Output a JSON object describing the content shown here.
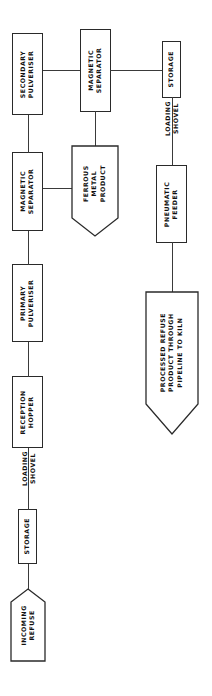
{
  "diagram": {
    "type": "process-flowchart",
    "orientation": "rotated-90-ccw",
    "title_visible": false,
    "background_color": "#ffffff",
    "line_color": "#3a3a3a",
    "text_color": "#111111",
    "nodes": [
      {
        "id": "incoming-refuse",
        "label": "INCOMING\nREFUSE",
        "line1": "INCOMING",
        "line2": "REFUSE",
        "shape": "pentagon",
        "role": "input-terminator"
      },
      {
        "id": "storage-in",
        "label": "STORAGE",
        "line1": "STORAGE",
        "shape": "rectangle",
        "role": "process"
      },
      {
        "id": "loading-shovel-1",
        "label": "LOADING\nSHOVEL",
        "line1": "LOADING",
        "line2": "SHOVEL",
        "shape": "edge-label",
        "role": "transport-annotation"
      },
      {
        "id": "reception-hopper",
        "label": "RECEPTION\nHOPPER",
        "line1": "RECEPTION",
        "line2": "HOPPER",
        "shape": "rectangle",
        "role": "process"
      },
      {
        "id": "primary-pulveriser",
        "label": "PRIMARY\nPULVERISER",
        "line1": "PRIMARY",
        "line2": "PULVERISER",
        "shape": "rectangle",
        "role": "process"
      },
      {
        "id": "magnetic-separator-1",
        "label": "MAGNETIC\nSEPARATOR",
        "line1": "MAGNETIC",
        "line2": "SEPARATOR",
        "shape": "rectangle",
        "role": "process"
      },
      {
        "id": "secondary-pulveriser",
        "label": "SECONDARY\nPULVERISER",
        "line1": "SECONDARY",
        "line2": "PULVERISER",
        "shape": "rectangle",
        "role": "process"
      },
      {
        "id": "magnetic-separator-2",
        "label": "MAGNETIC\nSEPARATOR",
        "line1": "MAGNETIC",
        "line2": "SEPARATOR",
        "shape": "rectangle",
        "role": "process"
      },
      {
        "id": "ferrous-metal-product",
        "label": "FERROUS\nMETAL\nPRODUCT",
        "line1": "FERROUS",
        "line2": "METAL",
        "line3": "PRODUCT",
        "shape": "pentagon",
        "role": "output-terminator"
      },
      {
        "id": "storage-out",
        "label": "STORAGE",
        "line1": "STORAGE",
        "shape": "rectangle",
        "role": "process"
      },
      {
        "id": "loading-shovel-2",
        "label": "LOADING\nSHOVEL",
        "line1": "LOADING",
        "line2": "SHOVEL",
        "shape": "edge-label",
        "role": "transport-annotation"
      },
      {
        "id": "pneumatic-feeder",
        "label": "PNEUMATIC\nFEEDER",
        "line1": "PNEUMATIC",
        "line2": "FEEDER",
        "shape": "rectangle",
        "role": "process"
      },
      {
        "id": "processed-refuse",
        "label": "PROCESSED REFUSE\nPRODUCT THROUGH\nPIPELINE TO KILN",
        "line1": "PROCESSED REFUSE",
        "line2": "PRODUCT THROUGH",
        "line3": "PIPELINE TO KILN",
        "shape": "pentagon",
        "role": "output-terminator"
      }
    ],
    "edges": [
      {
        "from": "incoming-refuse",
        "to": "storage-in",
        "label": ""
      },
      {
        "from": "storage-in",
        "to": "reception-hopper",
        "label": "LOADING SHOVEL"
      },
      {
        "from": "reception-hopper",
        "to": "primary-pulveriser",
        "label": ""
      },
      {
        "from": "primary-pulveriser",
        "to": "magnetic-separator-1",
        "label": ""
      },
      {
        "from": "magnetic-separator-1",
        "to": "secondary-pulveriser",
        "label": ""
      },
      {
        "from": "magnetic-separator-1",
        "to": "ferrous-metal-product",
        "label": ""
      },
      {
        "from": "secondary-pulveriser",
        "to": "magnetic-separator-2",
        "label": ""
      },
      {
        "from": "magnetic-separator-2",
        "to": "ferrous-metal-product",
        "label": ""
      },
      {
        "from": "magnetic-separator-2",
        "to": "storage-out",
        "label": ""
      },
      {
        "from": "storage-out",
        "to": "pneumatic-feeder",
        "label": "LOADING SHOVEL"
      },
      {
        "from": "pneumatic-feeder",
        "to": "processed-refuse",
        "label": ""
      }
    ]
  }
}
